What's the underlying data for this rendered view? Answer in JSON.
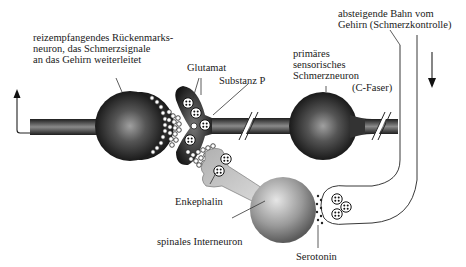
{
  "labels": {
    "dorsal_horn_neuron": "reizempfangendes Rückenmarks-\nneuron, das Schmerzsignale\nan das Gehirn weiterleitet",
    "glutamate": "Glutamat",
    "substance_p": "Substanz P",
    "primary_neuron": "primäres\nsensorisches\nSchmerzneuron",
    "c_fiber": "(C-Faser)",
    "descending_path": "absteigende Bahn vom\nGehirn (Schmerzkontrolle)",
    "enkephalin": "Enkephalin",
    "interneuron": "spinales Interneuron",
    "serotonin": "Serotonin"
  },
  "colors": {
    "neuron_dark": "#1e1e1e",
    "neuron_mid": "#777777",
    "neuron_light": "#bdbdbd",
    "line": "#333333",
    "background": "#ffffff"
  }
}
